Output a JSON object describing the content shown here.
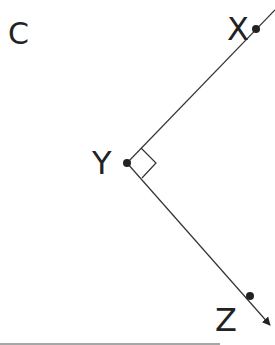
{
  "figure": {
    "panel_label": "C",
    "points": [
      {
        "name": "X",
        "x": 256,
        "y": 29
      },
      {
        "name": "Y",
        "x": 127,
        "y": 163
      },
      {
        "name": "Z",
        "x": 250,
        "y": 296
      }
    ],
    "angle_mark": "right-angle at Y",
    "colors": {
      "line": "#333333",
      "text": "#222222",
      "bottom_rule": "#888888"
    }
  }
}
